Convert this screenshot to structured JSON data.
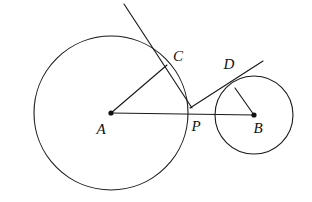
{
  "figure": {
    "background_color": "#ffffff",
    "stroke_color": "#1a1a1a",
    "label_color": "#111111",
    "width": 312,
    "height": 202
  },
  "labels": {
    "a": "A",
    "b": "B",
    "c": "C",
    "d": "D",
    "p": "P"
  },
  "chart_data": {
    "type": "diagram",
    "xlabel": "",
    "ylabel": "",
    "xlim": [
      0,
      312
    ],
    "ylim": [
      202,
      0
    ],
    "grid": false,
    "legend": null,
    "circles": [
      {
        "name": "circle-a",
        "center_label": "A",
        "cx": 111,
        "cy": 113,
        "r": 77,
        "filled": false
      },
      {
        "name": "circle-b",
        "center_label": "B",
        "cx": 254,
        "cy": 115,
        "r": 39,
        "filled": false
      }
    ],
    "points": [
      {
        "name": "A",
        "x": 111,
        "y": 113,
        "dot": true,
        "label_x": 101,
        "label_y": 134
      },
      {
        "name": "P",
        "x": 191,
        "y": 107,
        "dot": false,
        "label_x": 196,
        "label_y": 131
      },
      {
        "name": "B",
        "x": 254,
        "y": 115,
        "dot": true,
        "label_x": 258,
        "label_y": 133
      },
      {
        "name": "C",
        "x": 167,
        "y": 65,
        "dot": false,
        "label_x": 178,
        "label_y": 61
      },
      {
        "name": "D",
        "x": 235,
        "y": 88,
        "dot": false,
        "label_x": 229,
        "label_y": 69
      }
    ],
    "segments": [
      {
        "name": "segment-a-to-b",
        "x1": 111,
        "y1": 113,
        "x2": 254,
        "y2": 115
      },
      {
        "name": "segment-a-to-c",
        "x1": 111,
        "y1": 113,
        "x2": 167,
        "y2": 65
      },
      {
        "name": "segment-b-to-d",
        "x1": 254,
        "y1": 115,
        "x2": 235,
        "y2": 88
      },
      {
        "name": "tangent-line-through-c",
        "x1": 124,
        "y1": 4,
        "x2": 192,
        "y2": 108
      },
      {
        "name": "tangent-line-through-d",
        "x1": 190,
        "y1": 108,
        "x2": 263,
        "y2": 61
      }
    ]
  }
}
